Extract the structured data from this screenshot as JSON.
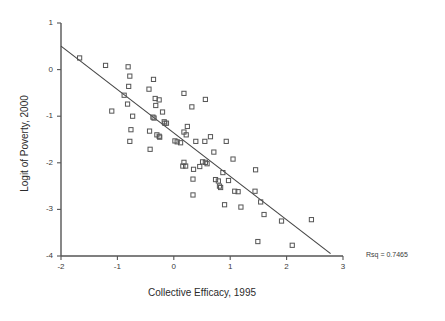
{
  "chart_data": {
    "type": "scatter",
    "title": "",
    "xlabel": "Collective Efficacy, 1995",
    "ylabel": "Logit of Poverty, 2000",
    "xlim": [
      -2,
      3
    ],
    "ylim": [
      -4,
      1
    ],
    "xticks": [
      -2,
      -1,
      0,
      1,
      2,
      3
    ],
    "xticklabels": [
      "-2",
      "-1",
      "0",
      "1",
      "2",
      "3"
    ],
    "yticks": [
      1,
      0,
      -1,
      -2,
      -3,
      -4
    ],
    "yticklabels": [
      "1",
      "0",
      "-1",
      "-2",
      "-3",
      "-4"
    ],
    "grid": false,
    "legend": null,
    "marker": "open-square",
    "marker_color": "#555555",
    "annotations": [
      {
        "name": "rsq",
        "text": "Rsq = 0.7465",
        "x": 3.6,
        "y": -3.75
      }
    ],
    "fit_line": {
      "name": "linear-regression-line",
      "slope": -0.932,
      "intercept": -1.36,
      "x_start": -2.0,
      "y_start": 0.505,
      "x_end": 2.78,
      "y_end": -3.95,
      "color": "#444444"
    },
    "series": [
      {
        "name": "neighborhoods",
        "points": [
          [
            -1.67,
            0.25
          ],
          [
            -1.21,
            0.09
          ],
          [
            -0.81,
            0.06
          ],
          [
            -0.78,
            -0.14
          ],
          [
            -0.36,
            -0.21
          ],
          [
            -0.8,
            -0.36
          ],
          [
            -0.44,
            -0.42
          ],
          [
            0.18,
            -0.51
          ],
          [
            -0.88,
            -0.55
          ],
          [
            -0.33,
            -0.62
          ],
          [
            -0.26,
            -0.65
          ],
          [
            0.56,
            -0.64
          ],
          [
            -0.82,
            -0.74
          ],
          [
            -0.32,
            -0.77
          ],
          [
            0.32,
            -0.8
          ],
          [
            -1.1,
            -0.89
          ],
          [
            -0.2,
            -0.91
          ],
          [
            -0.73,
            -1.0
          ],
          [
            -0.37,
            -1.02
          ],
          [
            -0.35,
            -1.04
          ],
          [
            -0.17,
            -1.12
          ],
          [
            -0.16,
            -1.15
          ],
          [
            -0.13,
            -1.15
          ],
          [
            0.24,
            -1.22
          ],
          [
            -0.76,
            -1.29
          ],
          [
            -0.43,
            -1.32
          ],
          [
            0.18,
            -1.34
          ],
          [
            -0.3,
            -1.4
          ],
          [
            0.22,
            -1.4
          ],
          [
            -0.26,
            -1.43
          ],
          [
            -0.25,
            -1.45
          ],
          [
            0.65,
            -1.44
          ],
          [
            -0.78,
            -1.54
          ],
          [
            0.02,
            -1.53
          ],
          [
            0.06,
            -1.55
          ],
          [
            0.39,
            -1.54
          ],
          [
            0.55,
            -1.54
          ],
          [
            0.93,
            -1.54
          ],
          [
            0.12,
            -1.57
          ],
          [
            -0.42,
            -1.71
          ],
          [
            0.71,
            -1.77
          ],
          [
            1.05,
            -1.92
          ],
          [
            0.18,
            -1.99
          ],
          [
            0.51,
            -1.98
          ],
          [
            0.56,
            -1.99
          ],
          [
            0.59,
            -2.02
          ],
          [
            0.16,
            -2.07
          ],
          [
            0.21,
            -2.07
          ],
          [
            0.46,
            -2.08
          ],
          [
            0.35,
            -2.14
          ],
          [
            1.45,
            -2.15
          ],
          [
            0.87,
            -2.21
          ],
          [
            0.34,
            -2.35
          ],
          [
            0.74,
            -2.36
          ],
          [
            0.79,
            -2.39
          ],
          [
            0.97,
            -2.38
          ],
          [
            0.81,
            -2.5
          ],
          [
            0.83,
            -2.53
          ],
          [
            1.08,
            -2.61
          ],
          [
            1.14,
            -2.62
          ],
          [
            1.44,
            -2.61
          ],
          [
            0.34,
            -2.69
          ],
          [
            1.54,
            -2.84
          ],
          [
            0.9,
            -2.9
          ],
          [
            1.19,
            -2.95
          ],
          [
            1.6,
            -3.11
          ],
          [
            1.91,
            -3.25
          ],
          [
            2.44,
            -3.22
          ],
          [
            1.49,
            -3.69
          ],
          [
            2.1,
            -3.77
          ]
        ]
      }
    ]
  },
  "axes": {
    "x_title": "Collective Efficacy, 1995",
    "y_title": "Logit of Poverty, 2000"
  }
}
